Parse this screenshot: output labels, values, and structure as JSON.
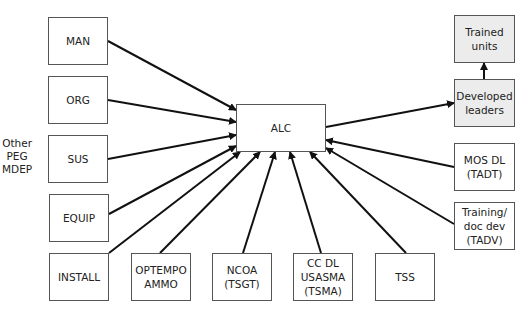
{
  "diagram": {
    "center": {
      "id": "alc",
      "label": "ALC",
      "x": 236,
      "y": 104,
      "w": 90,
      "h": 48
    },
    "side_label": {
      "text": "Other\nPEG\nMDEP",
      "x": 2,
      "y": 137
    },
    "inputs_left": [
      {
        "id": "man",
        "label": "MAN",
        "x": 48,
        "y": 17,
        "w": 60,
        "h": 48
      },
      {
        "id": "org",
        "label": "ORG",
        "x": 48,
        "y": 76,
        "w": 60,
        "h": 48
      },
      {
        "id": "sus",
        "label": "SUS",
        "x": 48,
        "y": 135,
        "w": 60,
        "h": 48
      },
      {
        "id": "equip",
        "label": "EQUIP",
        "x": 49,
        "y": 194,
        "w": 60,
        "h": 48
      },
      {
        "id": "install",
        "label": "INSTALL",
        "x": 49,
        "y": 253,
        "w": 60,
        "h": 48
      }
    ],
    "inputs_bottom": [
      {
        "id": "optempo",
        "label": "OPTEMPO\nAMMO",
        "x": 131,
        "y": 253,
        "w": 60,
        "h": 48
      },
      {
        "id": "ncoa",
        "label": "NCOA\n(TSGT)",
        "x": 212,
        "y": 253,
        "w": 60,
        "h": 48
      },
      {
        "id": "ccdl",
        "label": "CC DL\nUSASMA\n(TSMA)",
        "x": 293,
        "y": 253,
        "w": 60,
        "h": 48
      },
      {
        "id": "tss",
        "label": "TSS",
        "x": 375,
        "y": 253,
        "w": 60,
        "h": 48
      }
    ],
    "inputs_right": [
      {
        "id": "mosdl",
        "label": "MOS DL\n(TADT)",
        "x": 454,
        "y": 143,
        "w": 61,
        "h": 48
      },
      {
        "id": "tadv",
        "label": "Training/\ndoc dev\n(TADV)",
        "x": 454,
        "y": 202,
        "w": 61,
        "h": 48
      }
    ],
    "outputs": [
      {
        "id": "developed",
        "label": "Developed\nleaders",
        "x": 454,
        "y": 79,
        "w": 61,
        "h": 48,
        "shaded": true
      },
      {
        "id": "trained",
        "label": "Trained\nunits",
        "x": 454,
        "y": 15,
        "w": 61,
        "h": 48,
        "shaded": true
      }
    ],
    "arrows": [
      {
        "from": [
          108,
          41
        ],
        "to": [
          236,
          110
        ]
      },
      {
        "from": [
          108,
          100
        ],
        "to": [
          236,
          122
        ]
      },
      {
        "from": [
          108,
          159
        ],
        "to": [
          236,
          135
        ]
      },
      {
        "from": [
          109,
          214
        ],
        "to": [
          236,
          146
        ]
      },
      {
        "from": [
          109,
          253
        ],
        "to": [
          240,
          152
        ]
      },
      {
        "from": [
          160,
          253
        ],
        "to": [
          260,
          152
        ]
      },
      {
        "from": [
          243,
          253
        ],
        "to": [
          275,
          152
        ]
      },
      {
        "from": [
          321,
          253
        ],
        "to": [
          290,
          152
        ]
      },
      {
        "from": [
          406,
          253
        ],
        "to": [
          310,
          152
        ]
      },
      {
        "from": [
          454,
          167
        ],
        "to": [
          326,
          140
        ]
      },
      {
        "from": [
          454,
          224
        ],
        "to": [
          326,
          148
        ]
      },
      {
        "from": [
          326,
          127
        ],
        "to": [
          454,
          103
        ]
      },
      {
        "from": [
          484,
          79
        ],
        "to": [
          484,
          63
        ]
      }
    ],
    "colors": {
      "line": "#111111",
      "border": "#555555",
      "shaded": "#ececec"
    }
  }
}
